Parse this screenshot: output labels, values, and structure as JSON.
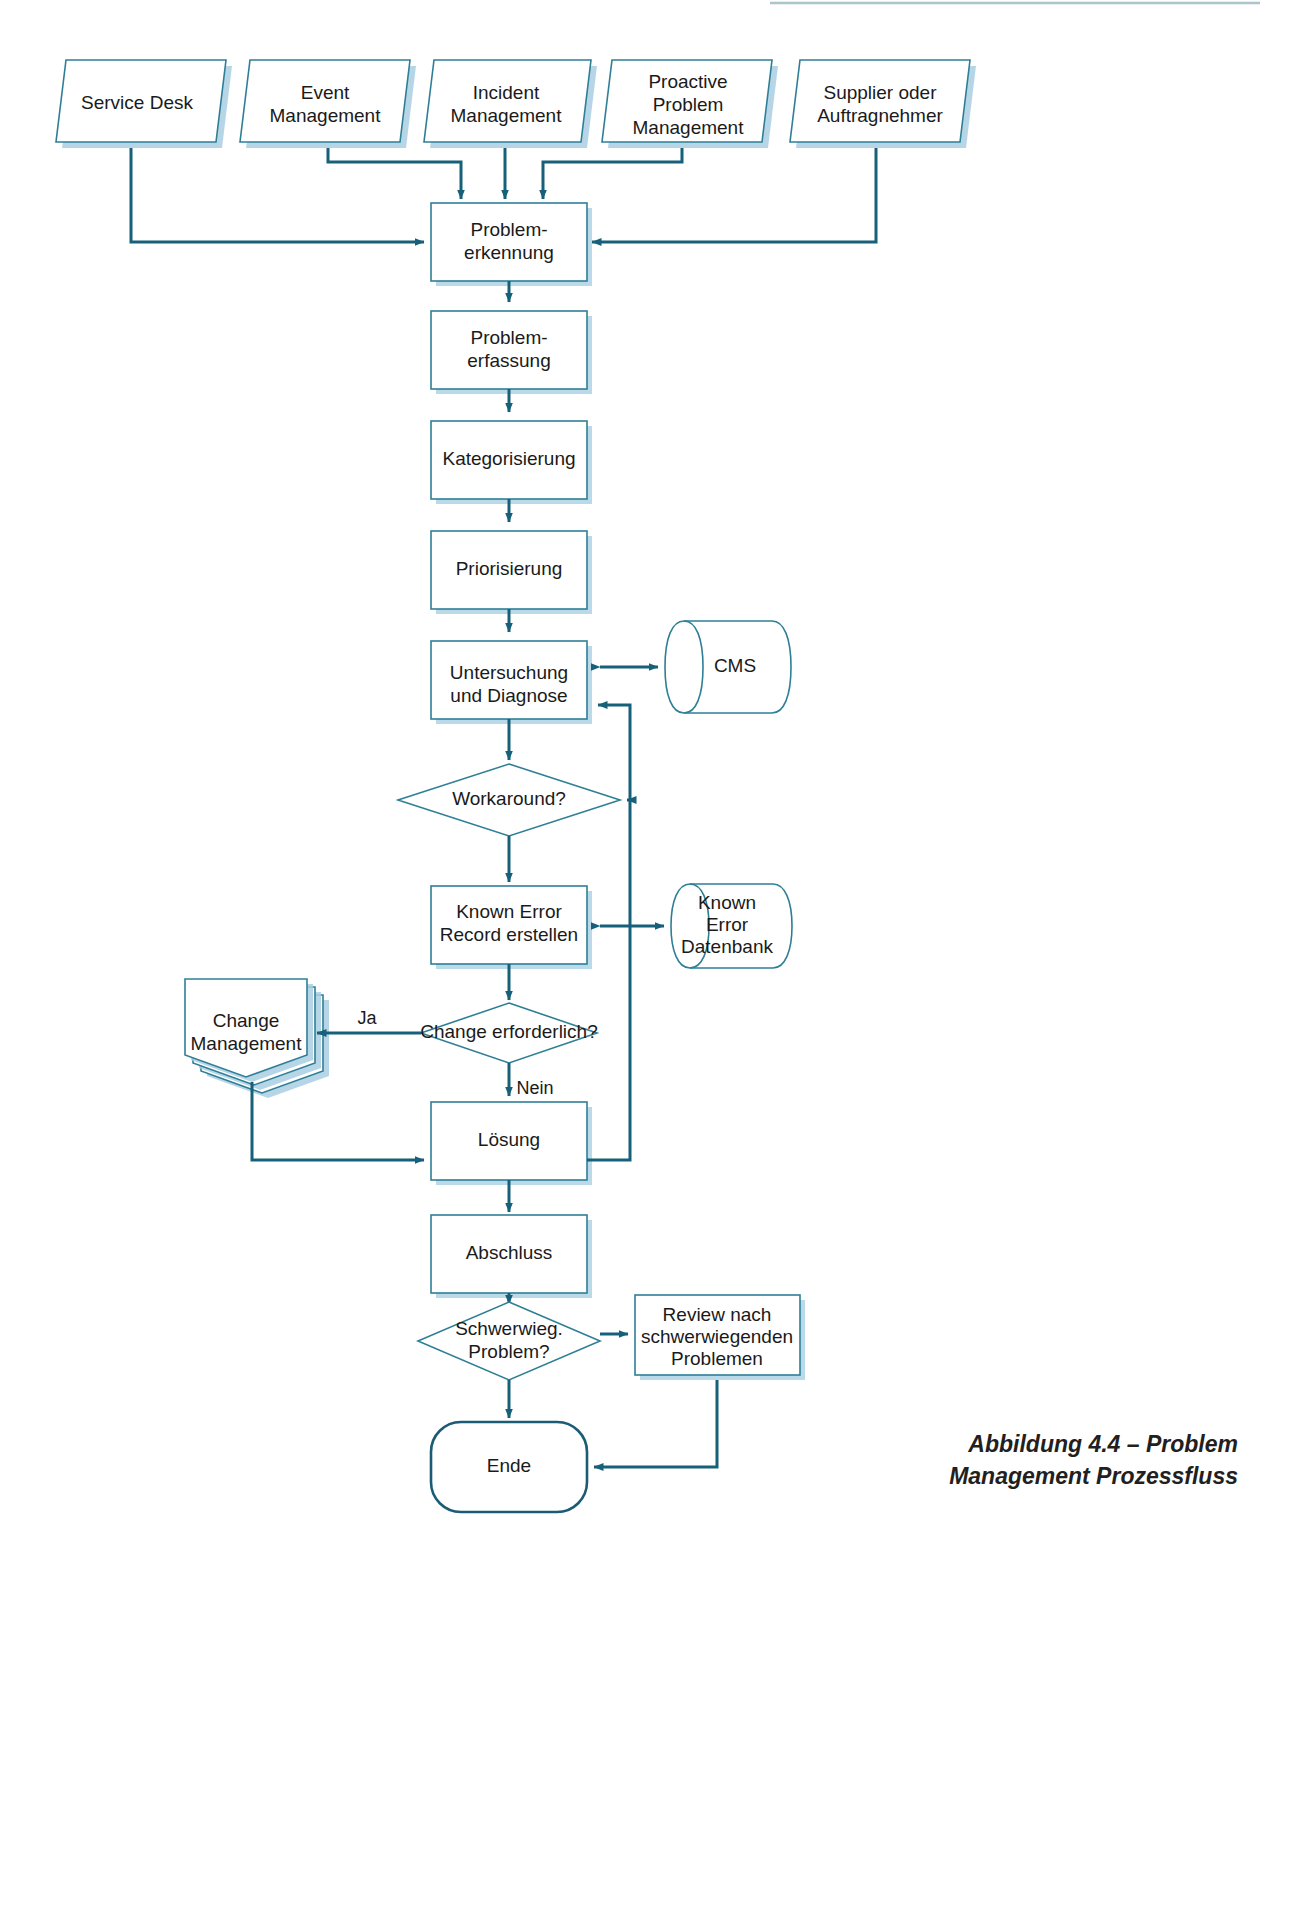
{
  "figure": {
    "caption_line1": "Abbildung 4.4 – Problem",
    "caption_line2": "Management Prozessfluss"
  },
  "colors": {
    "shape_border": "#2e7f96",
    "shape_border_dark": "#1b5c74",
    "shape_shadow": "#a9cfe3",
    "connector": "#166079",
    "text": "#1a1a1a",
    "background": "#ffffff"
  },
  "sources": [
    {
      "id": "service-desk",
      "label": "Service Desk",
      "lines": [
        "Service Desk"
      ]
    },
    {
      "id": "event-management",
      "label": "Event Management",
      "lines": [
        "Event",
        "Management"
      ]
    },
    {
      "id": "incident-management",
      "label": "Incident Management",
      "lines": [
        "Incident",
        "Management"
      ]
    },
    {
      "id": "proactive-problem-management",
      "label": "Proactive Problem Management",
      "lines": [
        "Proactive",
        "Problem",
        "Management"
      ]
    },
    {
      "id": "supplier-oder-auftragnehmer",
      "label": "Supplier oder Auftragnehmer",
      "lines": [
        "Supplier oder",
        "Auftragnehmer"
      ]
    }
  ],
  "process_steps": [
    {
      "id": "problemerkennung",
      "label": "Problem-erkennung",
      "lines": [
        "Problem-",
        "erkennung"
      ]
    },
    {
      "id": "problemerfassung",
      "label": "Problem-erfassung",
      "lines": [
        "Problem-",
        "erfassung"
      ]
    },
    {
      "id": "kategorisierung",
      "label": "Kategorisierung",
      "lines": [
        "Kategorisierung"
      ]
    },
    {
      "id": "priorisierung",
      "label": "Priorisierung",
      "lines": [
        "Priorisierung"
      ]
    },
    {
      "id": "untersuchung-und-diagnose",
      "label": "Untersuchung und Diagnose",
      "lines": [
        "Untersuchung",
        "und Diagnose"
      ]
    },
    {
      "id": "known-error-record-erstellen",
      "label": "Known Error Record erstellen",
      "lines": [
        "Known Error",
        "Record erstellen"
      ]
    },
    {
      "id": "loesung",
      "label": "Lösung",
      "lines": [
        "Lösung"
      ]
    },
    {
      "id": "abschluss",
      "label": "Abschluss",
      "lines": [
        "Abschluss"
      ]
    }
  ],
  "decisions": [
    {
      "id": "workaround",
      "label": "Workaround?",
      "lines": [
        "Workaround?"
      ]
    },
    {
      "id": "change-erforderlich",
      "label": "Change erforderlich?",
      "lines": [
        "Change erforderlich?"
      ]
    },
    {
      "id": "schwerwiegendes-problem",
      "label": "Schwerwieg. Problem?",
      "lines": [
        "Schwerwieg.",
        "Problem?"
      ]
    }
  ],
  "datastores": [
    {
      "id": "cms",
      "label": "CMS",
      "lines": [
        "CMS"
      ]
    },
    {
      "id": "known-error-datenbank",
      "label": "Known Error Datenbank",
      "lines": [
        "Known",
        "Error",
        "Datenbank"
      ]
    }
  ],
  "external_process": {
    "id": "change-management",
    "label": "Change Management",
    "lines": [
      "Change",
      "Management"
    ]
  },
  "review_box": {
    "id": "review-nach-schwerwiegenden-problemen",
    "label": "Review nach schwerwiegenden Problemen",
    "lines": [
      "Review nach",
      "schwerwiegenden",
      "Problemen"
    ]
  },
  "terminator": {
    "id": "ende",
    "label": "Ende",
    "lines": [
      "Ende"
    ]
  },
  "edge_labels": [
    {
      "id": "ja",
      "label": "Ja"
    },
    {
      "id": "nein",
      "label": "Nein"
    }
  ]
}
